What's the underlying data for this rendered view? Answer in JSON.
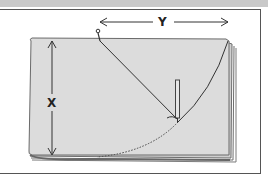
{
  "diagram": {
    "labels": {
      "x": "X",
      "y": "Y"
    },
    "colors": {
      "background": "#ffffff",
      "topbar": "#c9c9c9",
      "paper": "#dcdcdc",
      "paper_edge": "#6e6e6e",
      "line": "#333333",
      "frame": "#555555"
    },
    "elements": [
      "paper-sheet",
      "pin",
      "string",
      "pencil",
      "x-dimension-arrow",
      "y-dimension-arrow",
      "drawn-arc",
      "dotted-arc"
    ]
  }
}
